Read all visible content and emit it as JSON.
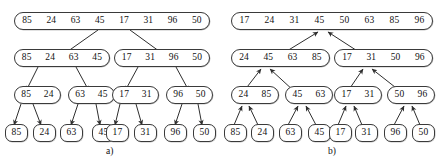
{
  "figure": {
    "type": "merge-sort-diagram",
    "panels": [
      {
        "id": "a",
        "caption": "a)",
        "phase": "split",
        "arrow_direction": "downward",
        "levels": [
          {
            "nodes": [
              {
                "values": [
                  "85",
                  "24",
                  "63",
                  "45",
                  "17",
                  "31",
                  "96",
                  "50"
                ]
              }
            ]
          },
          {
            "nodes": [
              {
                "values": [
                  "85",
                  "24",
                  "63",
                  "45"
                ]
              },
              {
                "values": [
                  "17",
                  "31",
                  "96",
                  "50"
                ]
              }
            ]
          },
          {
            "nodes": [
              {
                "values": [
                  "85",
                  "24"
                ]
              },
              {
                "values": [
                  "63",
                  "45"
                ]
              },
              {
                "values": [
                  "17",
                  "31"
                ]
              },
              {
                "values": [
                  "96",
                  "50"
                ]
              }
            ]
          },
          {
            "nodes": [
              {
                "values": [
                  "85"
                ]
              },
              {
                "values": [
                  "24"
                ]
              },
              {
                "values": [
                  "63"
                ]
              },
              {
                "values": [
                  "45"
                ]
              },
              {
                "values": [
                  "17"
                ]
              },
              {
                "values": [
                  "31"
                ]
              },
              {
                "values": [
                  "96"
                ]
              },
              {
                "values": [
                  "50"
                ]
              }
            ]
          }
        ]
      },
      {
        "id": "b",
        "caption": "b)",
        "phase": "merge",
        "arrow_direction": "upward",
        "levels": [
          {
            "nodes": [
              {
                "values": [
                  "17",
                  "24",
                  "31",
                  "45",
                  "50",
                  "63",
                  "85",
                  "96"
                ]
              }
            ]
          },
          {
            "nodes": [
              {
                "values": [
                  "24",
                  "45",
                  "63",
                  "85"
                ]
              },
              {
                "values": [
                  "17",
                  "31",
                  "50",
                  "96"
                ]
              }
            ]
          },
          {
            "nodes": [
              {
                "values": [
                  "24",
                  "85"
                ]
              },
              {
                "values": [
                  "45",
                  "63"
                ]
              },
              {
                "values": [
                  "17",
                  "31"
                ]
              },
              {
                "values": [
                  "50",
                  "96"
                ]
              }
            ]
          },
          {
            "nodes": [
              {
                "values": [
                  "85"
                ]
              },
              {
                "values": [
                  "24"
                ]
              },
              {
                "values": [
                  "63"
                ]
              },
              {
                "values": [
                  "45"
                ]
              },
              {
                "values": [
                  "17"
                ]
              },
              {
                "values": [
                  "31"
                ]
              },
              {
                "values": [
                  "96"
                ]
              },
              {
                "values": [
                  "50"
                ]
              }
            ]
          }
        ]
      }
    ]
  },
  "style": {
    "stroke": "#3a3a3a",
    "background": "#ffffff",
    "text": "#111111"
  }
}
